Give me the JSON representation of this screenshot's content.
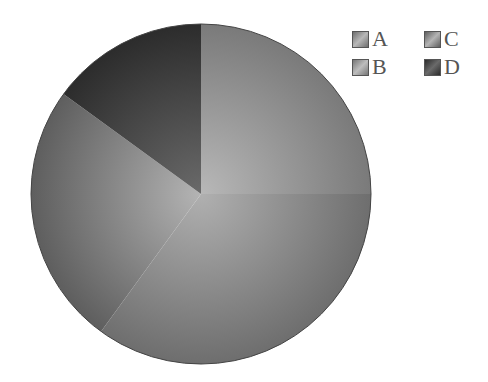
{
  "chart_data": {
    "type": "pie",
    "title": "",
    "categories": [
      "A",
      "B",
      "C",
      "D"
    ],
    "values": [
      25,
      35,
      25,
      15
    ],
    "start_angle": "12 o'clock",
    "direction": "clockwise",
    "colors": [
      "#9a9a9a",
      "#8c8c8c",
      "#8a8a8a",
      "#4a4a4a"
    ],
    "legend_position": "top-right"
  },
  "legend": {
    "items": [
      {
        "label": "A",
        "color": "#9a9a9a"
      },
      {
        "label": "C",
        "color": "#8a8a8a"
      },
      {
        "label": "B",
        "color": "#8c8c8c"
      },
      {
        "label": "D",
        "color": "#4a4a4a"
      }
    ]
  }
}
